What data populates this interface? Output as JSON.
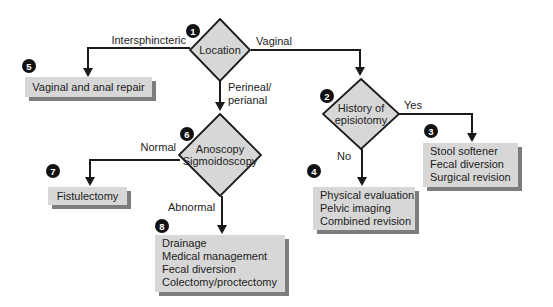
{
  "colors": {
    "background": "#ffffff",
    "node_fill": "#d7d7d7",
    "box_shadow": "#7d7d7d",
    "line": "#1a1a1a",
    "badge_bg": "#111111",
    "badge_text": "#ffffff",
    "text": "#1c1c1c"
  },
  "nodes": {
    "location": {
      "badge": "1",
      "line1": "Location"
    },
    "history": {
      "badge": "2",
      "line1": "History of",
      "line2": "episiotomy"
    },
    "anoscopy": {
      "badge": "6",
      "line1": "Anoscopy",
      "line2": "Sigmoidoscopy"
    },
    "stool": {
      "badge": "3",
      "lines": [
        "Stool softener",
        "Fecal diversion",
        "Surgical revision"
      ]
    },
    "physical": {
      "badge": "4",
      "lines": [
        "Physical evaluation",
        "Pelvic imaging",
        "Combined revision"
      ]
    },
    "vaginal_repair": {
      "badge": "5",
      "lines": [
        "Vaginal and anal repair"
      ]
    },
    "fistulectomy": {
      "badge": "7",
      "lines": [
        "Fistulectomy"
      ]
    },
    "drainage": {
      "badge": "8",
      "lines": [
        "Drainage",
        "Medical management",
        "Fecal diversion",
        "Colectomy/proctectomy"
      ]
    }
  },
  "branch_labels": {
    "intersphincteric": "Intersphincteric",
    "vaginal": "Vaginal",
    "perineal_line1": "Perineal/",
    "perineal_line2": "perianal",
    "yes": "Yes",
    "no": "No",
    "normal": "Normal",
    "abnormal": "Abnormal"
  }
}
